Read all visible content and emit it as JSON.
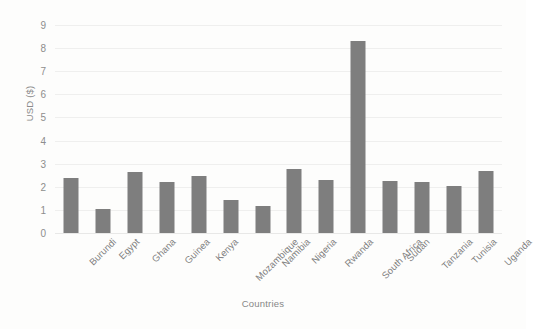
{
  "chart_data": {
    "type": "bar",
    "title": "",
    "xlabel": "Countries",
    "ylabel": "USD ($)",
    "ylim": [
      0,
      9
    ],
    "yticks": [
      0,
      1,
      2,
      3,
      4,
      5,
      6,
      7,
      8,
      9
    ],
    "grid": true,
    "legend": false,
    "bar_color": "#7e7e7e",
    "categories": [
      "Burundi",
      "Egypt",
      "Ghana",
      "Guinea",
      "Kenya",
      "Mozambique",
      "Namibia",
      "Nigeria",
      "Rwanda",
      "South Africa",
      "Sudan",
      "Tanzania",
      "Tunisia",
      "Uganda"
    ],
    "values": [
      2.4,
      1.05,
      2.65,
      2.2,
      2.45,
      1.45,
      1.15,
      2.75,
      2.3,
      8.3,
      2.25,
      2.2,
      2.05,
      2.7
    ]
  }
}
